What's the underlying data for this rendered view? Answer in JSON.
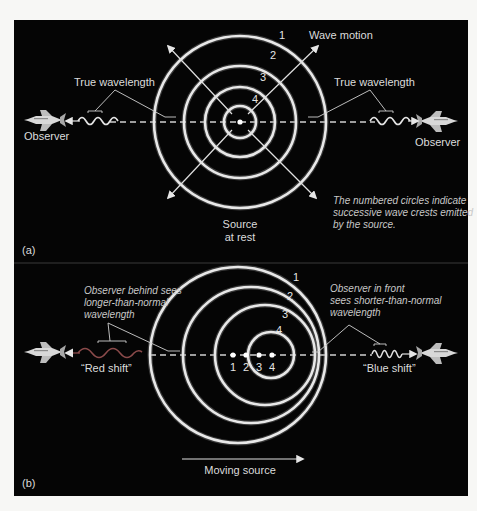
{
  "colors": {
    "background": "#f7f7f5",
    "panel": "#050505",
    "ring": "#e8e8e8",
    "text": "#dcdcdc",
    "red_shift_wave": "#8a4a4a",
    "blue_shift_wave": "#e0e0e0"
  },
  "panel_a": {
    "tag": "(a)",
    "wave_motion_label": "Wave motion",
    "true_wavelength_left": "True wavelength",
    "true_wavelength_right": "True wavelength",
    "observer_left": "Observer",
    "observer_right": "Observer",
    "source_line1": "Source",
    "source_line2": "at rest",
    "caption_line1": "The numbered circles indicate",
    "caption_line2": "successive wave crests emitted",
    "caption_line3": "by the source.",
    "circle_numbers": [
      "1",
      "2",
      "3",
      "4"
    ]
  },
  "panel_b": {
    "tag": "(b)",
    "behind_line1": "Observer behind sees",
    "behind_line2": "longer-than-normal",
    "behind_line3": "wavelength",
    "front_line1": "Observer  in front",
    "front_line2": "sees shorter-than-normal",
    "front_line3": "wavelength",
    "red_shift": "“Red shift”",
    "blue_shift": "“Blue shift”",
    "moving_source": "Moving source",
    "circle_numbers": [
      "1",
      "2",
      "3",
      "4"
    ],
    "source_positions": [
      "1",
      "2",
      "3",
      "4"
    ]
  },
  "icons": {
    "observer": "space-shuttle-icon",
    "source": "point-source-icon"
  }
}
